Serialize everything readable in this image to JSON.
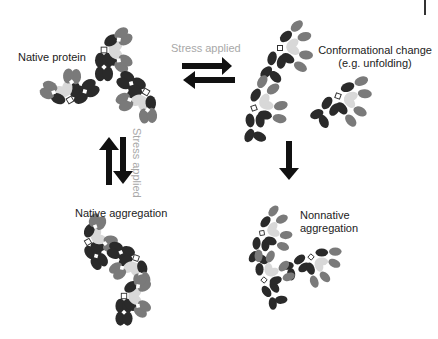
{
  "diagram": {
    "labels": {
      "native_protein": "Native protein",
      "conformational_change_1": "Conformational change",
      "conformational_change_2": "(e.g. unfolding)",
      "native_aggregation": "Native aggregation",
      "nonnative_aggregation_1": "Nonnative",
      "nonnative_aggregation_2": "aggregation",
      "stress_horizontal": "Stress applied",
      "stress_vertical": "Stress applied"
    },
    "arrows": [
      {
        "from": "native_protein",
        "to": "conformational_change",
        "type": "reversible",
        "label": "Stress applied"
      },
      {
        "from": "native_protein",
        "to": "native_aggregation",
        "type": "reversible",
        "label": "Stress applied"
      },
      {
        "from": "conformational_change",
        "to": "nonnative_aggregation",
        "type": "irreversible"
      }
    ],
    "colors": {
      "dark": "#2a2a2a",
      "mid": "#7a7a7a",
      "light": "#d8d8d8",
      "label_gray": "#a8a8a8",
      "arrow": "#111111"
    }
  }
}
